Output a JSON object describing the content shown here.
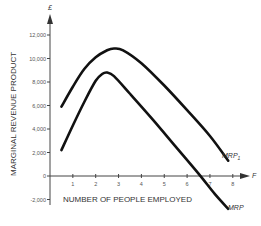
{
  "chart_data": {
    "type": "line",
    "title": "",
    "xlabel": "NUMBER OF PEOPLE EMPLOYED",
    "ylabel": "MARGINAL REVENUE PRODUCT",
    "y_unit": "£",
    "x_axis_symbol": "F",
    "x_ticks": [
      "1",
      "2",
      "3",
      "4",
      "5",
      "6",
      "7",
      "8"
    ],
    "y_ticks": [
      "-2,000",
      "0",
      "2,000",
      "4,000",
      "6,000",
      "8,000",
      "10,000",
      "12,000"
    ],
    "xlim": [
      0,
      8.3
    ],
    "ylim": [
      -2500,
      12800
    ],
    "grid": false,
    "series": [
      {
        "name": "MRP1",
        "label_main": "MRP",
        "label_sub": "1",
        "x": [
          0.5,
          1,
          1.5,
          2,
          2.5,
          2.8,
          3.2,
          4,
          5,
          6,
          7,
          7.8
        ],
        "values": [
          5900,
          7600,
          9100,
          10100,
          10700,
          10850,
          10700,
          9600,
          7700,
          5600,
          3400,
          1300
        ]
      },
      {
        "name": "MRP",
        "label_main": "MRP",
        "label_sub": "",
        "x": [
          0.5,
          1,
          1.5,
          2,
          2.3,
          2.5,
          2.8,
          3.5,
          4.5,
          5.5,
          6.5,
          7.2,
          7.8
        ],
        "values": [
          2200,
          4300,
          6300,
          8100,
          8700,
          8800,
          8500,
          7000,
          4800,
          2500,
          200,
          -1500,
          -2800
        ]
      }
    ]
  }
}
